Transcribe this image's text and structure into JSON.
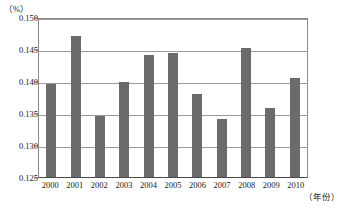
{
  "chart_data": {
    "type": "bar",
    "title": "",
    "subtitle": "",
    "xlabel": "（年份）",
    "ylabel": "（%）",
    "categories": [
      "2000",
      "2001",
      "2002",
      "2003",
      "2004",
      "2005",
      "2006",
      "2007",
      "2008",
      "2009",
      "2010"
    ],
    "values": [
      0.1396,
      0.147,
      0.1346,
      0.1399,
      0.144,
      0.1443,
      0.138,
      0.1341,
      0.1451,
      0.1358,
      0.1405
    ],
    "series": [
      {
        "name": "",
        "values": [
          0.1396,
          0.147,
          0.1346,
          0.1399,
          0.144,
          0.1443,
          0.138,
          0.1341,
          0.1451,
          0.1358,
          0.1405
        ]
      }
    ],
    "ylim": [
      0.125,
      0.15
    ],
    "ytick_values": [
      0.15,
      0.145,
      0.14,
      0.135,
      0.13,
      0.125
    ],
    "ytick_labels": [
      "0.150",
      "0.145",
      "0.140",
      "0.135",
      "0.130",
      "0.125"
    ],
    "grid": true,
    "grid_axis": "y",
    "legend": null,
    "legend_position": "none",
    "bar_color": "#6b6b6b",
    "plot_border_color": "#8a8a8a",
    "gridline_color": "#9a9a9a",
    "background_color": "#ffffff"
  },
  "axes": {
    "y_unit_caption": "（%）",
    "x_unit_caption": "（年份）"
  }
}
